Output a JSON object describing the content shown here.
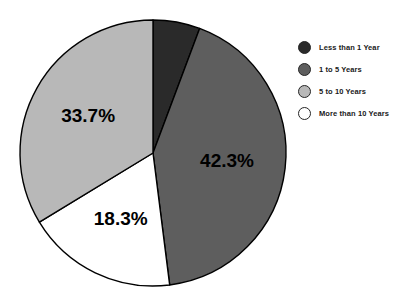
{
  "chart_data": {
    "type": "pie",
    "title": "",
    "subtitle": "",
    "xlabel": "",
    "ylabel": "",
    "grid": false,
    "legend_position": "right",
    "start_angle_deg": 0,
    "direction": "clockwise",
    "categories": [
      "Less than 1 Year",
      "1 to 5 Years",
      "5 to 10 Years",
      "More than 10 Years"
    ],
    "values": [
      5.7,
      42.3,
      33.7,
      18.3
    ],
    "value_labels": [
      "",
      "42.3%",
      "33.7%",
      "18.3%"
    ],
    "colors": [
      "#2a2a2a",
      "#5e5e5e",
      "#b8b8b8",
      "#ffffff"
    ],
    "slice_order_clockwise": [
      "Less than 1 Year",
      "1 to 5 Years",
      "More than 10 Years",
      "5 to 10 Years"
    ],
    "slices": [
      {
        "label": "Less than 1 Year",
        "value": 5.7,
        "display": "",
        "color": "#2a2a2a",
        "show_label": false
      },
      {
        "label": "1 to 5 Years",
        "value": 42.3,
        "display": "42.3%",
        "color": "#5e5e5e",
        "show_label": true
      },
      {
        "label": "More than 10 Years",
        "value": 18.3,
        "display": "18.3%",
        "color": "#ffffff",
        "show_label": true
      },
      {
        "label": "5 to 10 Years",
        "value": 33.7,
        "display": "33.7%",
        "color": "#b8b8b8",
        "show_label": true
      }
    ]
  },
  "legend": {
    "items": [
      {
        "label": "Less than 1 Year",
        "color": "#2a2a2a"
      },
      {
        "label": "1 to 5 Years",
        "color": "#5e5e5e"
      },
      {
        "label": "5 to 10 Years",
        "color": "#b8b8b8"
      },
      {
        "label": "More than 10 Years",
        "color": "#ffffff"
      }
    ]
  },
  "geometry": {
    "center_x": 153,
    "center_y": 153,
    "radius": 133,
    "outline_color": "#000000"
  }
}
